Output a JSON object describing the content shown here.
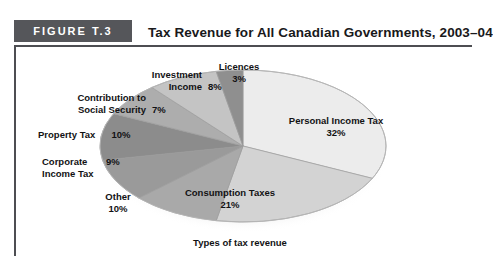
{
  "figure": {
    "band_label": "FIGURE T.3",
    "title": "Tax Revenue for All Canadian Governments, 2003–04",
    "caption": "Types of tax revenue",
    "band_color": "#55565a",
    "rule_color": "#4d4e52"
  },
  "chart_data": {
    "type": "pie",
    "title": "Tax Revenue for All Canadian Governments, 2003–04",
    "xlabel": "Types of tax revenue",
    "ylabel": "",
    "legend_position": "none",
    "grid": false,
    "units": "percent",
    "total": 100,
    "categories": [
      "Personal Income Tax",
      "Consumption Taxes",
      "Other",
      "Corporate Income Tax",
      "Property Tax",
      "Contribution to Social Security",
      "Investment Income",
      "Licences"
    ],
    "values": [
      32,
      21,
      10,
      9,
      10,
      7,
      8,
      3
    ],
    "slices": [
      {
        "label": "Personal Income Tax",
        "value": 32,
        "value_text": "32%",
        "color": "#ececec"
      },
      {
        "label": "Consumption Taxes",
        "value": 21,
        "value_text": "21%",
        "color": "#d3d3d3"
      },
      {
        "label": "Other",
        "value": 10,
        "value_text": "10%",
        "color": "#a9a9a9"
      },
      {
        "label": "Corporate Income Tax",
        "value": 9,
        "value_text": "9%",
        "color": "#9a9a9a"
      },
      {
        "label": "Property Tax",
        "value": 10,
        "value_text": "10%",
        "color": "#8c8c8c"
      },
      {
        "label": "Contribution to Social Security",
        "value": 7,
        "value_text": "7%",
        "color": "#adadad"
      },
      {
        "label": "Investment Income",
        "value": 8,
        "value_text": "8%",
        "color": "#c4c4c4"
      },
      {
        "label": "Licences",
        "value": 3,
        "value_text": "3%",
        "color": "#8f8f8f"
      }
    ]
  },
  "labels": {
    "licences": {
      "name": "Licences",
      "pct": "3%"
    },
    "investment_income": {
      "name_line1": "Investment",
      "name_line2": "Income",
      "pct": "8%"
    },
    "social_security": {
      "name_line1": "Contribution to",
      "name_line2": "Social Security",
      "pct": "7%"
    },
    "property_tax": {
      "name": "Property Tax",
      "pct": "10%"
    },
    "corporate_income_tax": {
      "name_line1": "Corporate",
      "name_line2": "Income Tax",
      "pct": "9%"
    },
    "other": {
      "name": "Other",
      "pct": "10%"
    },
    "consumption_taxes": {
      "name": "Consumption Taxes",
      "pct": "21%"
    },
    "personal_income_tax": {
      "name": "Personal Income Tax",
      "pct": "32%"
    }
  }
}
